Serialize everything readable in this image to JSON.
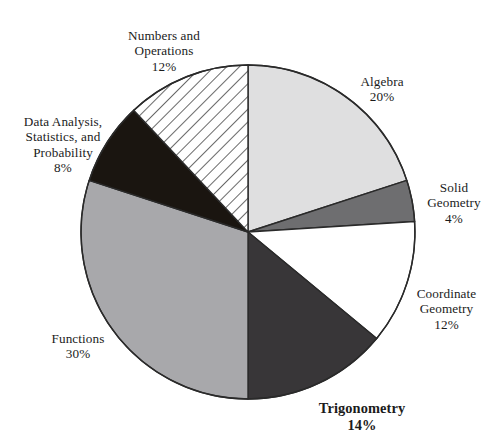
{
  "chart_data": {
    "type": "pie",
    "title": "",
    "subtitle": "",
    "xlabel": "",
    "ylabel": "",
    "legend_position": "none",
    "grid": false,
    "units": "percent",
    "total": 100,
    "start_angle_deg": -90,
    "direction": "clockwise",
    "categories": [
      "Algebra",
      "Solid Geometry",
      "Coordinate Geometry",
      "Trigonometry",
      "Functions",
      "Data Analysis, Statistics, and Probability",
      "Numbers and Operations"
    ],
    "values": [
      20,
      4,
      12,
      14,
      30,
      8,
      12
    ],
    "slices": [
      {
        "name": "algebra",
        "label": "Algebra",
        "label_lines": [
          "Algebra"
        ],
        "value": 20,
        "percent_text": "20%",
        "fill": "#dfdfe0",
        "pattern": "solid",
        "emphasis": false
      },
      {
        "name": "solid-geometry",
        "label": "Solid Geometry",
        "label_lines": [
          "Solid",
          "Geometry"
        ],
        "value": 4,
        "percent_text": "4%",
        "fill": "#6e6e70",
        "pattern": "solid",
        "emphasis": false
      },
      {
        "name": "coordinate-geometry",
        "label": "Coordinate Geometry",
        "label_lines": [
          "Coordinate",
          "Geometry"
        ],
        "value": 12,
        "percent_text": "12%",
        "fill": "#ffffff",
        "pattern": "solid",
        "emphasis": false
      },
      {
        "name": "trigonometry",
        "label": "Trigonometry",
        "label_lines": [
          "Trigonometry"
        ],
        "value": 14,
        "percent_text": "14%",
        "fill": "#383638",
        "pattern": "solid",
        "emphasis": true
      },
      {
        "name": "functions",
        "label": "Functions",
        "label_lines": [
          "Functions"
        ],
        "value": 30,
        "percent_text": "30%",
        "fill": "#a8a8ab",
        "pattern": "solid",
        "emphasis": false
      },
      {
        "name": "data-analysis",
        "label": "Data Analysis, Statistics, and Probability",
        "label_lines": [
          "Data Analysis,",
          "Statistics, and",
          "Probability"
        ],
        "value": 8,
        "percent_text": "8%",
        "fill": "#1a1510",
        "pattern": "solid",
        "emphasis": false
      },
      {
        "name": "numbers-and-operations",
        "label": "Numbers and Operations",
        "label_lines": [
          "Numbers and",
          "Operations"
        ],
        "value": 12,
        "percent_text": "12%",
        "fill": "#ffffff",
        "pattern": "diagonal-hatch",
        "emphasis": false
      }
    ],
    "stroke_color": "#2a2a2a",
    "background": "#ffffff"
  }
}
